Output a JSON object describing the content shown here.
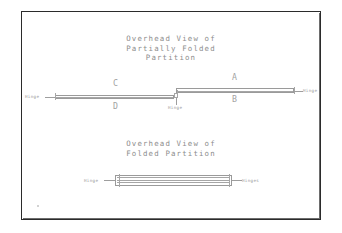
{
  "document": {
    "kind": "hand-drawn-engineering-sketch",
    "background_color": "#ffffff",
    "ink_color": "#9a9a9a",
    "frame_color": "#2b2b2b"
  },
  "top_diagram": {
    "title_line1": "Overhead View of",
    "title_line2": "Partially Folded",
    "title_line3": "Partition",
    "labels": {
      "panel_a": "A",
      "panel_b": "B",
      "panel_c": "C",
      "panel_d": "D",
      "hinge_left": "Hinge",
      "hinge_center": "Hinge",
      "hinge_right": "Hinge"
    }
  },
  "bottom_diagram": {
    "title_line1": "Overhead View of",
    "title_line2": "Folded Partition",
    "labels": {
      "hinge_left": "Hinge",
      "hinges_right": "Hinges"
    }
  }
}
